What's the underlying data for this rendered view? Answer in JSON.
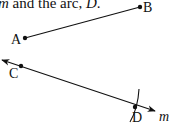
{
  "caption": {
    "var_m": "m",
    "middle": " and the arc, ",
    "var_d": "D",
    "end": "."
  },
  "diagram": {
    "points": [
      {
        "label": "A",
        "x": 25,
        "y": 38
      },
      {
        "label": "B",
        "x": 140,
        "y": 7
      },
      {
        "label": "C",
        "x": 21,
        "y": 66
      },
      {
        "label": "D",
        "x": 135,
        "y": 107
      }
    ],
    "segment": {
      "from": "A",
      "to": "B"
    },
    "line": {
      "label": "m",
      "through": [
        "C",
        "D"
      ]
    },
    "arc": {
      "label": "D"
    },
    "labels": {
      "A": "A",
      "B": "B",
      "C": "C",
      "D": "D",
      "m": "m"
    }
  }
}
